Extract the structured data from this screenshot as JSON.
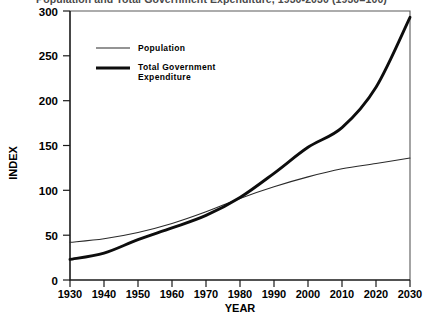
{
  "chart_data": {
    "type": "line",
    "title": "Population and Total Government Expenditure, 1930-2030 (1930=100)",
    "xlabel": "YEAR",
    "ylabel": "INDEX",
    "xlim": [
      1930,
      2030
    ],
    "ylim": [
      0,
      300
    ],
    "grid": false,
    "legend_position": "upper-left-inside",
    "x": [
      1930,
      1940,
      1950,
      1960,
      1970,
      1980,
      1990,
      2000,
      2010,
      2020,
      2030
    ],
    "xticks": [
      "1930",
      "1940",
      "1950",
      "1960",
      "1970",
      "1980",
      "1990",
      "2000",
      "2010",
      "2020",
      "2030"
    ],
    "yticks": [
      "0",
      "50",
      "100",
      "150",
      "200",
      "250",
      "300"
    ],
    "series": [
      {
        "name": "Population",
        "line_weight": "thin",
        "color": "#2a2a2a",
        "values": [
          42,
          46,
          53,
          63,
          76,
          91,
          104,
          115,
          124,
          130,
          136
        ]
      },
      {
        "name": "Total Government Expenditure",
        "line_weight": "thick",
        "color": "#0d0d0d",
        "values": [
          23,
          30,
          45,
          58,
          72,
          92,
          119,
          148,
          170,
          215,
          293
        ]
      }
    ]
  },
  "legend": {
    "items": [
      {
        "label": "Population"
      },
      {
        "label_line1": "Total Government",
        "label_line2": "Expenditure"
      }
    ]
  },
  "axes": {
    "y_title": "INDEX",
    "x_title": "YEAR"
  }
}
